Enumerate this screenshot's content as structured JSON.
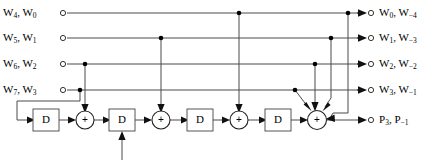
{
  "diagram": {
    "background_color": "#ffffff",
    "line_color": "#4a4a4a",
    "inputs": [
      {
        "id": "in-row-1",
        "text": "W4, W0",
        "base_a": "W",
        "sub_a": "4",
        "base_b": "W",
        "sub_b": "0"
      },
      {
        "id": "in-row-2",
        "text": "W5, W1",
        "base_a": "W",
        "sub_a": "5",
        "base_b": "W",
        "sub_b": "1"
      },
      {
        "id": "in-row-3",
        "text": "W6, W2",
        "base_a": "W",
        "sub_a": "6",
        "base_b": "W",
        "sub_b": "2"
      },
      {
        "id": "in-row-4",
        "text": "W7, W3",
        "base_a": "W",
        "sub_a": "7",
        "base_b": "W",
        "sub_b": "3"
      }
    ],
    "outputs": [
      {
        "id": "out-row-1",
        "text": "W0, W-4",
        "base_a": "W",
        "sub_a": "0",
        "base_b": "W",
        "sub_b": "−4"
      },
      {
        "id": "out-row-2",
        "text": "W1, W-3",
        "base_a": "W",
        "sub_a": "1",
        "base_b": "W",
        "sub_b": "−3"
      },
      {
        "id": "out-row-3",
        "text": "W2, W-2",
        "base_a": "W",
        "sub_a": "2",
        "base_b": "W",
        "sub_b": "−2"
      },
      {
        "id": "out-row-4",
        "text": "W3, W-1",
        "base_a": "W",
        "sub_a": "3",
        "base_b": "W",
        "sub_b": "−1"
      },
      {
        "id": "out-row-5",
        "text": "P3, P-1",
        "base_a": "P",
        "sub_a": "3",
        "base_b": "P",
        "sub_b": "−1"
      }
    ],
    "delay_blocks": [
      {
        "id": "delay-1",
        "label": "D"
      },
      {
        "id": "delay-2",
        "label": "D"
      },
      {
        "id": "delay-3",
        "label": "D"
      },
      {
        "id": "delay-4",
        "label": "D"
      }
    ],
    "adders": [
      {
        "id": "adder-1",
        "label": "+"
      },
      {
        "id": "adder-2",
        "label": "+"
      },
      {
        "id": "adder-3",
        "label": "+"
      },
      {
        "id": "adder-4",
        "label": "+"
      }
    ],
    "row_y": [
      13,
      38,
      64,
      90,
      120
    ],
    "geometry": {
      "left_port_x": 63,
      "right_port_x": 371,
      "arrow_right_x": 365,
      "delay_x": [
        46,
        122,
        200,
        278
      ],
      "adder_x": [
        85,
        161,
        239,
        317
      ],
      "block_w": 26,
      "block_h": 22,
      "adder_r": 9,
      "taps": {
        "row3_to_adder1": 85,
        "row2_to_adder2": 161,
        "row1_to_adder3": 239,
        "final_row1": 348,
        "final_row2": 331,
        "final_row3": 315,
        "final_row4": 295
      }
    }
  }
}
